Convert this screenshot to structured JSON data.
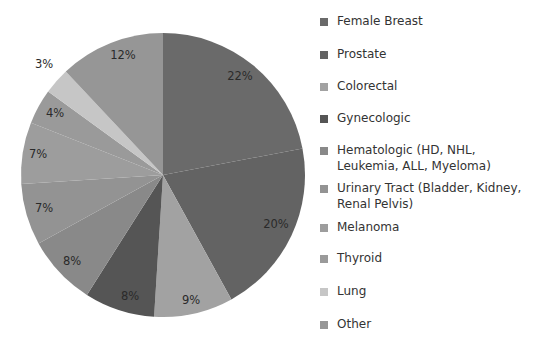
{
  "chart_data": {
    "type": "pie",
    "title": "",
    "start_angle_deg": 0,
    "direction": "clockwise",
    "legend_position": "right",
    "categories": [
      "Female Breast",
      "Prostate",
      "Colorectal",
      "Gynecologic",
      "Hematologic (HD, NHL, Leukemia, ALL, Myeloma)",
      "Urinary Tract (Bladder, Kidney, Renal Pelvis)",
      "Melanoma",
      "Thyroid",
      "Lung",
      "Other"
    ],
    "values": [
      22,
      20,
      9,
      8,
      8,
      7,
      7,
      4,
      3,
      12
    ],
    "data_labels": [
      "22%",
      "20%",
      "9%",
      "8%",
      "8%",
      "7%",
      "7%",
      "4%",
      "3%",
      "12%"
    ],
    "colors": [
      "#6a6a6a",
      "#636363",
      "#a2a2a2",
      "#555555",
      "#898989",
      "#939393",
      "#9d9d9d",
      "#9a9a9a",
      "#c6c6c6",
      "#969696"
    ]
  },
  "legend": {
    "items": [
      {
        "label": "Female Breast",
        "top": 3
      },
      {
        "label": "Prostate",
        "top": 36
      },
      {
        "label": "Colorectal",
        "top": 68
      },
      {
        "label": "Gynecologic",
        "top": 100
      },
      {
        "label": "Hematologic (HD, NHL, Leukemia, ALL, Myeloma)",
        "top": 132
      },
      {
        "label": "Urinary Tract (Bladder, Kidney, Renal Pelvis)",
        "top": 170
      },
      {
        "label": "Melanoma",
        "top": 209
      },
      {
        "label": "Thyroid",
        "top": 240
      },
      {
        "label": "Lung",
        "top": 273
      },
      {
        "label": "Other",
        "top": 306
      }
    ]
  },
  "layout": {
    "cx": 163,
    "cy": 175,
    "r": 142,
    "label_positions": [
      [
        240,
        80
      ],
      [
        276,
        228
      ],
      [
        191,
        304
      ],
      [
        130,
        300
      ],
      [
        72,
        265
      ],
      [
        44,
        212
      ],
      [
        38,
        158
      ],
      [
        55,
        117
      ],
      [
        44,
        68
      ],
      [
        123,
        59
      ]
    ]
  }
}
